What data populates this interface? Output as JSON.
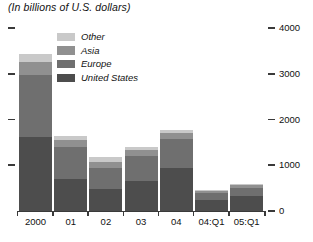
{
  "subtitle": "(In billions of U.S. dollars)",
  "legend": {
    "items": [
      {
        "label": "Other",
        "color": "#c9c9c9"
      },
      {
        "label": "Asia",
        "color": "#909090"
      },
      {
        "label": "Europe",
        "color": "#6f6f6f"
      },
      {
        "label": "United States",
        "color": "#4d4d4d"
      }
    ]
  },
  "axis": {
    "y_ticks": [
      "0",
      "1000",
      "2000",
      "3000",
      "4000"
    ],
    "y_tick_values": [
      0,
      1000,
      2000,
      3000,
      4000
    ],
    "y_min": 0,
    "y_max": 4000,
    "x_labels": [
      "2000",
      "01",
      "02",
      "03",
      "04",
      "04:Q1",
      "05:Q1"
    ]
  },
  "chart_data": {
    "type": "bar",
    "stacked": true,
    "title": "",
    "subtitle": "(In billions of U.S. dollars)",
    "xlabel": "",
    "ylabel": "",
    "ylim": [
      0,
      4000
    ],
    "grid": false,
    "legend_position": "inside-top-left",
    "categories": [
      "2000",
      "01",
      "02",
      "03",
      "04",
      "04:Q1",
      "05:Q1"
    ],
    "series": [
      {
        "name": "United States",
        "color": "#4d4d4d",
        "values": [
          1620,
          700,
          480,
          650,
          940,
          250,
          330
        ]
      },
      {
        "name": "Europe",
        "color": "#6f6f6f",
        "values": [
          1350,
          700,
          450,
          560,
          640,
          150,
          180
        ]
      },
      {
        "name": "Asia",
        "color": "#909090",
        "values": [
          285,
          160,
          150,
          120,
          130,
          40,
          50
        ]
      },
      {
        "name": "Other",
        "color": "#c9c9c9",
        "values": [
          175,
          80,
          100,
          70,
          60,
          20,
          30
        ]
      }
    ],
    "totals": [
      3430,
      1640,
      1180,
      1400,
      1770,
      460,
      590
    ]
  }
}
